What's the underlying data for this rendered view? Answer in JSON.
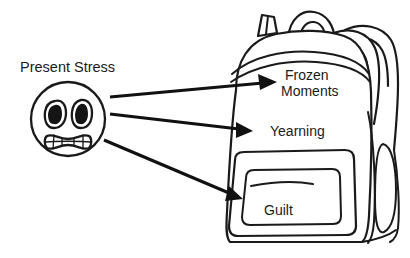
{
  "figure": {
    "title": "Present Stress",
    "source_label": {
      "text": "Present Stress",
      "name": "present-stress-label"
    },
    "face": {
      "name": "stressed-face-icon",
      "expression": "grimacing",
      "description": "Round face with two wide oval eyes and clenched gritted teeth"
    },
    "container": {
      "name": "backpack-illustration",
      "description": "Backpack with shoulder straps, top handle and front zip pocket"
    },
    "arrows": [
      {
        "name": "arrow-to-frozen-moments",
        "from": "Present Stress",
        "to": "Frozen Moments"
      },
      {
        "name": "arrow-to-yearning",
        "from": "Present Stress",
        "to": "Yearning"
      },
      {
        "name": "arrow-to-guilt",
        "from": "Present Stress",
        "to": "Guilt"
      }
    ],
    "labels": {
      "frozen_line1": "Frozen",
      "frozen_line2": "Moments",
      "yearning": "Yearning",
      "guilt": "Guilt"
    },
    "colors": {
      "ink": "#1a1a1a",
      "arrow": "#111111",
      "background": "#ffffff"
    }
  }
}
